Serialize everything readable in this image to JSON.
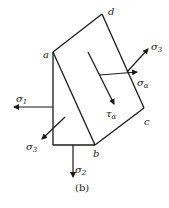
{
  "figure": {
    "caption": "(b)",
    "points": {
      "a": {
        "label": "a",
        "x": 53,
        "y": 52
      },
      "b": {
        "label": "b",
        "x": 95,
        "y": 145
      },
      "c": {
        "label": "c",
        "x": 144,
        "y": 108
      },
      "d": {
        "label": "d",
        "x": 102,
        "y": 14
      }
    },
    "stresses": {
      "sigma1": {
        "symbol": "σ",
        "sub": "1"
      },
      "sigma2": {
        "symbol": "σ",
        "sub": "2"
      },
      "sigma3_left": {
        "symbol": "σ",
        "sub": "3"
      },
      "sigma3_right": {
        "symbol": "σ",
        "sub": "3"
      },
      "sigma_alpha": {
        "symbol": "σ",
        "sub": "α"
      },
      "tau_alpha": {
        "symbol": "τ",
        "sub": "α"
      }
    },
    "colors": {
      "stroke": "#1a1a1a",
      "background": "#ffffff"
    }
  }
}
